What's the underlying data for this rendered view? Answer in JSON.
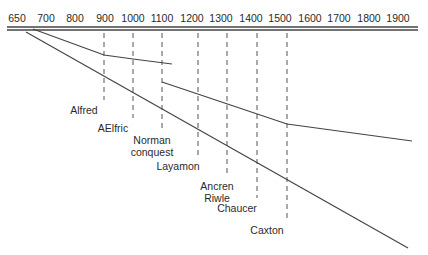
{
  "axis": {
    "years": [
      "650",
      "700",
      "800",
      "900",
      "1000",
      "1100",
      "1200",
      "1300",
      "1400",
      "1500",
      "1600",
      "1700",
      "1800",
      "1900"
    ],
    "tick_x": [
      17,
      46,
      75,
      105,
      133,
      162,
      192,
      221,
      251,
      280,
      310,
      339,
      369,
      398
    ]
  },
  "events": [
    {
      "label_lines": [
        "Alfred"
      ],
      "year": "900",
      "x": 104,
      "dash_end": 100,
      "label_y": 104
    },
    {
      "label_lines": [
        "AElfric"
      ],
      "year": "1000",
      "x": 133,
      "dash_end": 118,
      "label_y": 122
    },
    {
      "label_lines": [
        "Norman",
        "conquest"
      ],
      "year": "1100",
      "x": 162,
      "dash_end": 163,
      "label_y": 134
    },
    {
      "label_lines": [
        "Layamon"
      ],
      "year": "1200",
      "x": 198,
      "dash_end": 176,
      "label_y": 160
    },
    {
      "label_lines": [
        "Ancren",
        "Riwle"
      ],
      "year": "1300",
      "x": 227,
      "dash_end": 200,
      "label_y": 180
    },
    {
      "label_lines": [
        "Chaucer"
      ],
      "year": "1400",
      "x": 257,
      "dash_end": 207,
      "label_y": 202
    },
    {
      "label_lines": [
        "Caxton"
      ],
      "year": "1500",
      "x": 287,
      "dash_end": 222,
      "label_y": 224
    }
  ],
  "lines": [
    {
      "name": "main-descent-line",
      "points": [
        [
          26,
          32
        ],
        [
          408,
          248
        ]
      ]
    },
    {
      "name": "upper-branch-line",
      "points": [
        [
          33,
          29
        ],
        [
          104,
          55
        ],
        [
          133,
          59
        ],
        [
          172,
          64
        ]
      ]
    },
    {
      "name": "middle-branch-line",
      "points": [
        [
          162,
          82
        ],
        [
          287,
          124
        ],
        [
          412,
          141
        ]
      ]
    }
  ],
  "colors": {
    "line": "#444444",
    "text": "#2a2a2a",
    "dash": "#555555"
  }
}
